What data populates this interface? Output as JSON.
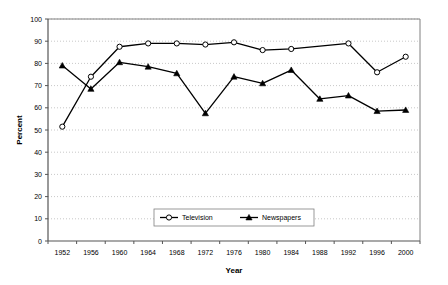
{
  "chart_data": {
    "type": "line",
    "title": "",
    "xlabel": "Year",
    "ylabel": "Percent",
    "categories": [
      "1952",
      "1956",
      "1960",
      "1964",
      "1968",
      "1972",
      "1976",
      "1980",
      "1984",
      "1988",
      "1992",
      "1996",
      "2000"
    ],
    "xlim": [
      1952,
      2000
    ],
    "ylim": [
      0,
      100
    ],
    "ytick_step": 10,
    "yticks": [
      "0",
      "10",
      "20",
      "30",
      "40",
      "50",
      "60",
      "70",
      "80",
      "90",
      "100"
    ],
    "grid": "horizontal-dotted",
    "legend_position": "bottom-center",
    "series": [
      {
        "name": "Television",
        "marker": "open-circle",
        "color": "#000000",
        "values": [
          51.5,
          74,
          87.5,
          89,
          89,
          88.5,
          89.5,
          86,
          86.5,
          null,
          89,
          76,
          83
        ]
      },
      {
        "name": "Newspapers",
        "marker": "filled-triangle",
        "color": "#000000",
        "values": [
          79,
          68.5,
          80.5,
          78.5,
          75.5,
          57.5,
          74,
          71,
          77,
          64,
          65.5,
          58.5,
          59
        ]
      }
    ]
  },
  "legend": {
    "items": [
      {
        "label": "Television",
        "marker": "open-circle"
      },
      {
        "label": "Newspapers",
        "marker": "filled-triangle"
      }
    ]
  },
  "axes": {
    "y_title": "Percent",
    "x_title": "Year"
  },
  "colors": {
    "line": "#000000",
    "grid": "#b0b0b0",
    "axis": "#555555",
    "background": "#ffffff"
  }
}
